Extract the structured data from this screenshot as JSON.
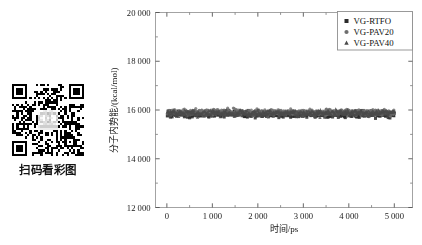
{
  "sidebar": {
    "qr_code": {
      "name": "qr-code",
      "caption": "扫码看彩图"
    }
  },
  "chart_data": {
    "type": "scatter",
    "title": "",
    "xlabel": "时间/ps",
    "ylabel": "分子内势能/(kcal/mol)",
    "xlim": [
      -250,
      5400
    ],
    "ylim": [
      12000,
      20000
    ],
    "xticks": [
      0,
      1000,
      2000,
      3000,
      4000,
      5000
    ],
    "xticklabels": [
      "0",
      "1 000",
      "2 000",
      "3 000",
      "4 000",
      "5 000"
    ],
    "yticks": [
      12000,
      14000,
      16000,
      18000,
      20000
    ],
    "yticklabels": [
      "12 000",
      "14 000",
      "16 000",
      "18 000",
      "20 000"
    ],
    "minor_ticks_per_interval": 1,
    "grid": false,
    "legend_position": "top-right",
    "series": [
      {
        "name": "VG-RTFO",
        "marker": "square",
        "color": "#2b2b2b",
        "mean": 15830,
        "noise_amplitude": 190,
        "n_points": 520
      },
      {
        "name": "VG-PAV20",
        "marker": "circle",
        "color": "#6e6e6e",
        "mean": 15905,
        "noise_amplitude": 190,
        "n_points": 520
      },
      {
        "name": "VG-PAV40",
        "marker": "triangle",
        "color": "#4a4a4a",
        "mean": 15870,
        "noise_amplitude": 190,
        "n_points": 520
      }
    ]
  }
}
